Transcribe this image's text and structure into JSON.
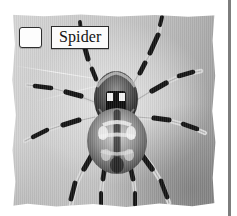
{
  "card": {
    "kind": "labeled-photo-card",
    "label_row": {
      "checkbox_state": "unchecked",
      "label_text": "Spider"
    },
    "photo": {
      "subject": "spider",
      "description": "Grayscale photograph of a garden spider hanging in its web, viewed from above",
      "rendering": "grayscale"
    }
  },
  "colors": {
    "page_background": "#ffffff",
    "photo_light": "#d6d6d6",
    "photo_mid": "#bdbdbd",
    "photo_dark": "#8f8f8f",
    "spider_dark": "#1a1a1a",
    "spider_light": "#e8e8e8",
    "box_fill": "#fbfbfb",
    "box_border": "#2b2b2b",
    "text": "#121212",
    "divider": "#7d7d7d"
  },
  "icons": {
    "checkbox": "checkbox-unchecked-icon",
    "divider": "vertical-divider"
  }
}
